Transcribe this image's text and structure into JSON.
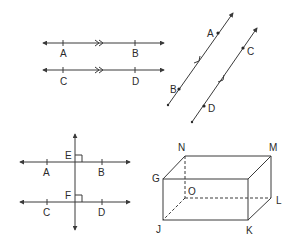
{
  "figures": {
    "parallel_horizontal": {
      "line1": {
        "points": [
          "A",
          "B"
        ]
      },
      "line2": {
        "points": [
          "C",
          "D"
        ]
      },
      "marker": "double-arrow parallel marks"
    },
    "parallel_oblique": {
      "line1": {
        "points": [
          "A",
          "B"
        ]
      },
      "line2": {
        "points": [
          "C",
          "D"
        ]
      },
      "marker": "single-arrow parallel marks"
    },
    "perpendicular_transversal": {
      "line1": {
        "points": [
          "A",
          "B"
        ],
        "intersection": "E"
      },
      "line2": {
        "points": [
          "C",
          "D"
        ],
        "intersection": "F"
      },
      "marker": "right-angle marks"
    },
    "rectangular_prism": {
      "vertices": [
        "N",
        "M",
        "G",
        "O",
        "L",
        "J",
        "K"
      ]
    }
  },
  "labels": {
    "h_A": "A",
    "h_B": "B",
    "h_C": "C",
    "h_D": "D",
    "o_A": "A",
    "o_B": "B",
    "o_C": "C",
    "o_D": "D",
    "p_E": "E",
    "p_F": "F",
    "p_A": "A",
    "p_B": "B",
    "p_C": "C",
    "p_D": "D",
    "b_N": "N",
    "b_M": "M",
    "b_G": "G",
    "b_O": "O",
    "b_L": "L",
    "b_J": "J",
    "b_K": "K"
  },
  "colors": {
    "stroke": "#3a3a3a",
    "text": "#2a2a2a",
    "background": "#ffffff"
  }
}
